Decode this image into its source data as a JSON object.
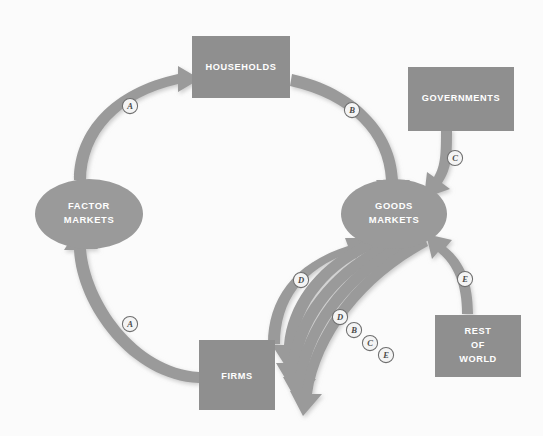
{
  "diagram": {
    "background_color": "#fbfbfb",
    "node_fill": "#8f8f8f",
    "flow_fill": "#9a9a9a",
    "label_color": "#ffffff",
    "badge_fill": "#f4f4f4",
    "badge_stroke": "#6e6e6e",
    "nodes": [
      {
        "id": "households",
        "shape": "rect",
        "label": "HOUSEHOLDS",
        "lines": [
          "HOUSEHOLDS"
        ],
        "x": 192,
        "y": 36,
        "w": 98,
        "h": 62
      },
      {
        "id": "governments",
        "shape": "rect",
        "label": "GOVERNMENTS",
        "lines": [
          "GOVERNMENTS"
        ],
        "x": 408,
        "y": 67,
        "w": 106,
        "h": 64
      },
      {
        "id": "factor-markets",
        "shape": "ellipse",
        "label": "FACTOR MARKETS",
        "lines": [
          "FACTOR",
          "MARKETS"
        ],
        "cx": 89,
        "cy": 214,
        "rx": 54,
        "ry": 35
      },
      {
        "id": "goods-markets",
        "shape": "ellipse",
        "label": "GOODS MARKETS",
        "lines": [
          "GOODS",
          "MARKETS"
        ],
        "cx": 394,
        "cy": 214,
        "rx": 53,
        "ry": 35
      },
      {
        "id": "firms",
        "shape": "rect",
        "label": "FIRMS",
        "lines": [
          "FIRMS"
        ],
        "x": 199,
        "y": 340,
        "w": 76,
        "h": 70
      },
      {
        "id": "rest-of-world",
        "shape": "rect",
        "label": "REST OF WORLD",
        "lines": [
          "REST",
          "OF",
          "WORLD"
        ],
        "x": 435,
        "y": 315,
        "w": 86,
        "h": 62
      }
    ],
    "flows": [
      {
        "id": "flow-a-top",
        "badge": "A",
        "from": "factor-markets",
        "to": "households",
        "badge_x": 130,
        "badge_y": 106
      },
      {
        "id": "flow-b-top",
        "badge": "B",
        "from": "households",
        "to": "goods-markets",
        "badge_x": 352,
        "badge_y": 110
      },
      {
        "id": "flow-c-gov",
        "badge": "C",
        "from": "governments",
        "to": "goods-markets",
        "badge_x": 455,
        "badge_y": 158
      },
      {
        "id": "flow-a-bottom",
        "badge": "A",
        "from": "firms",
        "to": "factor-markets",
        "badge_x": 130,
        "badge_y": 324
      },
      {
        "id": "flow-d-up",
        "badge": "D",
        "from": "firms",
        "to": "goods-markets",
        "badge_x": 301,
        "badge_y": 280
      },
      {
        "id": "flow-d-down",
        "badge": "D",
        "from": "goods-markets",
        "to": "firms",
        "badge_x": 340,
        "badge_y": 317
      },
      {
        "id": "flow-b-down",
        "badge": "B",
        "from": "goods-markets",
        "to": "firms",
        "badge_x": 354,
        "badge_y": 330
      },
      {
        "id": "flow-c-down",
        "badge": "C",
        "from": "goods-markets",
        "to": "firms",
        "badge_x": 370,
        "badge_y": 343
      },
      {
        "id": "flow-e-down",
        "badge": "E",
        "from": "goods-markets",
        "to": "firms",
        "badge_x": 386,
        "badge_y": 355
      },
      {
        "id": "flow-e-row",
        "badge": "E",
        "from": "rest-of-world",
        "to": "goods-markets",
        "badge_x": 465,
        "badge_y": 279
      }
    ]
  }
}
